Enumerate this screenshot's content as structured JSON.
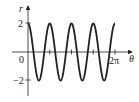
{
  "chart_data": {
    "type": "line",
    "title": "",
    "xlabel": "θ",
    "ylabel": "r",
    "function": "r = 2cos(4θ)",
    "xlim": [
      0,
      6.2832
    ],
    "ylim": [
      -3,
      3
    ],
    "x_ticks": [
      {
        "value": 0,
        "label": "0"
      },
      {
        "value": 1.5708,
        "label": ""
      },
      {
        "value": 3.1416,
        "label": ""
      },
      {
        "value": 4.7124,
        "label": ""
      },
      {
        "value": 6.2832,
        "label": "2π"
      }
    ],
    "y_ticks": [
      {
        "value": 2,
        "label": "2"
      },
      {
        "value": -2,
        "label": "−2"
      }
    ],
    "series": [
      {
        "name": "r = 2cos(4θ)",
        "x": [
          0,
          0.3927,
          0.7854,
          1.1781,
          1.5708,
          1.9635,
          2.3562,
          2.7489,
          3.1416,
          3.5343,
          3.927,
          4.3197,
          4.7124,
          5.1051,
          5.4978,
          5.8905,
          6.2832
        ],
        "values": [
          2,
          0,
          -2,
          0,
          2,
          0,
          -2,
          0,
          2,
          0,
          -2,
          0,
          2,
          0,
          -2,
          0,
          2
        ]
      }
    ],
    "grid": false,
    "legend": "none"
  },
  "labels": {
    "r_axis": "r",
    "theta_axis": "θ",
    "origin": "0",
    "y_pos": "2",
    "y_neg": "−2",
    "x_end": "2π"
  }
}
